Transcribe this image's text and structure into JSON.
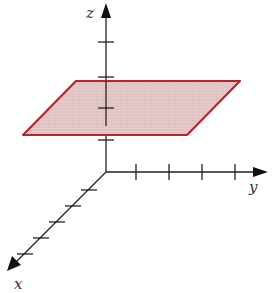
{
  "figure": {
    "axes": {
      "x": {
        "label": "x",
        "ticks": 5
      },
      "y": {
        "label": "y",
        "ticks": 4
      },
      "z": {
        "label": "z",
        "ticks": 4
      }
    },
    "plane": {
      "stroke_color": "#b5262a",
      "fill_color": "#e3c3c3"
    },
    "axis_color": "#222222"
  }
}
